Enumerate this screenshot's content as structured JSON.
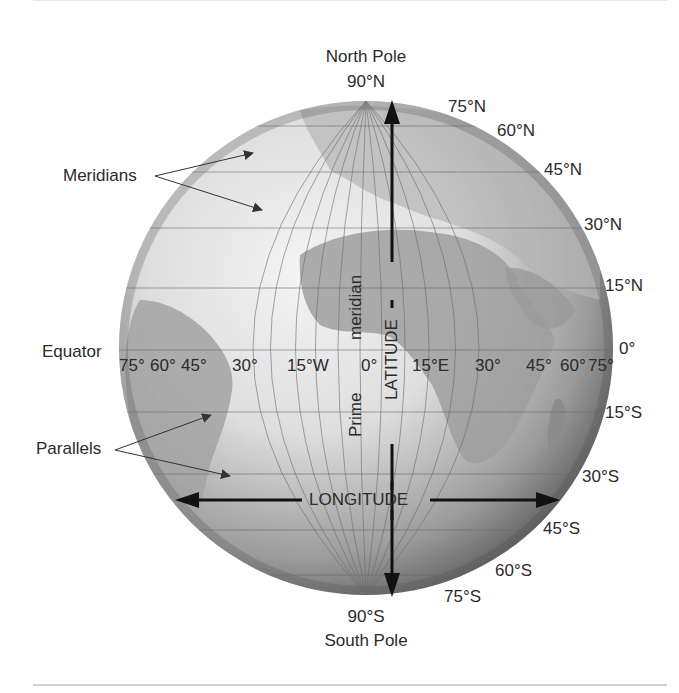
{
  "diagram": {
    "colors": {
      "globe_light": "#f2f2f2",
      "globe_dark": "#5a5a5a",
      "land": "#a9a9a9",
      "grid_line": "#6b6b6b",
      "arrow": "#111111",
      "text": "#2b2b2b",
      "rule": "#cfcfcf"
    },
    "poles": {
      "north_name": "North Pole",
      "north_lat": "90°N",
      "south_lat": "90°S",
      "south_name": "South Pole"
    },
    "callouts": {
      "meridians": "Meridians",
      "equator": "Equator",
      "parallels": "Parallels"
    },
    "axes": {
      "latitude": "LATITUDE",
      "longitude": "LONGITUDE",
      "prime_meridian_word1": "Prime",
      "prime_meridian_word2": "meridian"
    },
    "latitude_labels_north": [
      "75°N",
      "60°N",
      "45°N",
      "30°N",
      "15°N"
    ],
    "equator_label": "0°",
    "latitude_labels_south": [
      "15°S",
      "30°S",
      "45°S",
      "60°S",
      "75°S"
    ],
    "longitude_labels": [
      "75°",
      "60°",
      "45°",
      "30°",
      "15°W",
      "0°",
      "15°E",
      "30°",
      "45°",
      "60°",
      "75°"
    ]
  }
}
